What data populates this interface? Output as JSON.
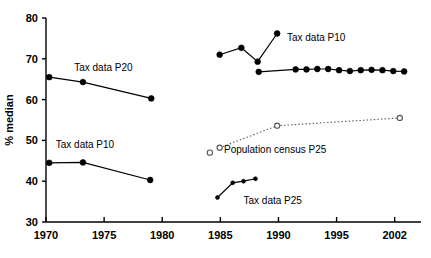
{
  "chart_data": {
    "type": "line",
    "title": "",
    "xlabel": "",
    "ylabel": "% median",
    "xlim": [
      1970,
      2004
    ],
    "ylim": [
      30,
      80
    ],
    "grid": false,
    "legend_position": "inline-annotations",
    "x_tick_labels": [
      "1970",
      "1975",
      "1980",
      "1985",
      "1990",
      "1995",
      "2002"
    ],
    "x_tick_values": [
      1970,
      1975,
      1980,
      1985,
      1990,
      1995,
      2002
    ],
    "y_tick_labels": [
      "30",
      "40",
      "50",
      "60",
      "70",
      "80"
    ],
    "y_tick_values": [
      30,
      40,
      50,
      60,
      70,
      80
    ],
    "series": [
      {
        "name": "Tax data P20",
        "marker": "filled-circle",
        "line": "solid",
        "x": [
          1970.3,
          1973.4,
          1979.7
        ],
        "values": [
          65.5,
          64.3,
          60.3
        ]
      },
      {
        "name": "Tax data P10 upper",
        "marker": "filled-circle",
        "line": "solid",
        "x": [
          1986.0,
          1988.0,
          1989.5,
          1991.3
        ],
        "values": [
          71.0,
          72.7,
          69.3,
          76.2
        ]
      },
      {
        "name": "Tax data P10 plateau",
        "marker": "filled-circle",
        "line": "solid",
        "x": [
          1989.6,
          1993.0,
          1994.0,
          1995.0,
          1996.0,
          1997.0,
          1998.0,
          1999.0,
          2000.0,
          2001.0,
          2002.0,
          2003.0
        ],
        "values": [
          66.8,
          67.4,
          67.4,
          67.5,
          67.5,
          67.2,
          67.0,
          67.2,
          67.3,
          67.2,
          67.0,
          66.9
        ]
      },
      {
        "name": "Population census P25",
        "marker": "open-circle",
        "line": "dotted",
        "x": [
          1986.0,
          1991.3,
          2002.6
        ],
        "values": [
          48.2,
          53.6,
          55.5
        ]
      },
      {
        "name": "Tax data P25",
        "marker": "filled-circle",
        "line": "solid",
        "x": [
          1985.8,
          1987.2,
          1988.2,
          1989.3
        ],
        "values": [
          36.0,
          39.6,
          40.0,
          40.6
        ]
      },
      {
        "name": "Tax data P10 lower",
        "marker": "filled-circle",
        "line": "solid",
        "x": [
          1970.3,
          1973.4,
          1979.6
        ],
        "values": [
          44.5,
          44.6,
          40.3
        ]
      }
    ],
    "annotations": [
      {
        "text": "Tax data P20",
        "x": 1972.6,
        "y": 66.9
      },
      {
        "text": "Tax data P10",
        "x": 1992.2,
        "y": 74.4
      },
      {
        "text": "Population census P25",
        "x": 1986.4,
        "y": 47.0
      },
      {
        "text": "Tax data P25",
        "x": 1988.2,
        "y": 34.5
      },
      {
        "text": "Tax data P10",
        "x": 1970.9,
        "y": 48.2
      }
    ],
    "legend_markers": [
      {
        "for": "Population census P25",
        "x": 1985.1,
        "y": 47.0,
        "marker": "open-circle"
      }
    ],
    "colors": {
      "line": "#000000",
      "marker_fill": "#000000",
      "open_marker_fill": "#ffffff",
      "dotted_line": "#555555",
      "axis": "#000000",
      "background": "#ffffff"
    }
  }
}
